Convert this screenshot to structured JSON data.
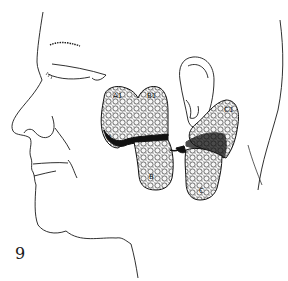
{
  "figure": {
    "number": "9",
    "colors": {
      "line": "#1a1a1a",
      "background": "#ffffff",
      "lobe_fill": "#f4f4f4",
      "shadow": "#111111"
    },
    "labels": {
      "a1": "A1",
      "b1": "B1",
      "b": "B",
      "c1": "C1",
      "c": "C",
      "a": "A"
    }
  }
}
